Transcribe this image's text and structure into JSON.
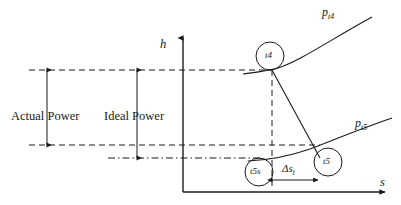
{
  "figure": {
    "type": "h-s thermodynamic expansion diagram",
    "background_color": "#ffffff",
    "line_color": "#1a1a1a"
  },
  "axes": {
    "vertical": {
      "label": "h",
      "name": "enthalpy-axis",
      "arrow": "up"
    },
    "horizontal": {
      "label": "s",
      "name": "entropy-axis",
      "arrow": "right"
    }
  },
  "annotations": {
    "actual_power": "Actual Power",
    "ideal_power": "Ideal Power",
    "delta_s": "Δs",
    "delta_s_sub": "t"
  },
  "curves": [
    {
      "label": "p",
      "sub": "t4",
      "name": "isobar-pt4"
    },
    {
      "label": "p",
      "sub": "t5",
      "name": "isobar-pt5"
    }
  ],
  "state_points": [
    {
      "label": "t4",
      "name": "state-point-t4"
    },
    {
      "label": "t5",
      "name": "state-point-t5"
    },
    {
      "label": "t5s",
      "name": "state-point-t5s"
    }
  ]
}
